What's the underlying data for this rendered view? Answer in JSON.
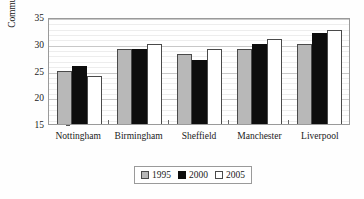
{
  "chart_data": {
    "type": "bar",
    "title": "",
    "xlabel": "",
    "ylabel": "Commuting Time (minutes)",
    "categories": [
      "Nottingham",
      "Birmingham",
      "Sheffield",
      "Manchester",
      "Liverpool"
    ],
    "series": [
      {
        "name": "1995",
        "color": "#b8b8b8",
        "values": [
          25.0,
          29.0,
          28.0,
          29.0,
          30.0
        ]
      },
      {
        "name": "2000",
        "color": "#0d0d0d",
        "values": [
          25.8,
          29.0,
          27.0,
          30.0,
          32.0
        ]
      },
      {
        "name": "2005",
        "color": "#ffffff",
        "values": [
          24.0,
          30.0,
          29.0,
          30.8,
          32.5
        ]
      }
    ],
    "ylim": [
      15,
      35
    ],
    "yticks": [
      15,
      20,
      25,
      30,
      35
    ],
    "yticklabels": [
      "15",
      "20",
      "25",
      "30",
      "35"
    ],
    "minor_gridlines": true,
    "grid": true,
    "legend_position": "bottom-center",
    "legend_entries": [
      "1995",
      "2000",
      "2005"
    ]
  }
}
